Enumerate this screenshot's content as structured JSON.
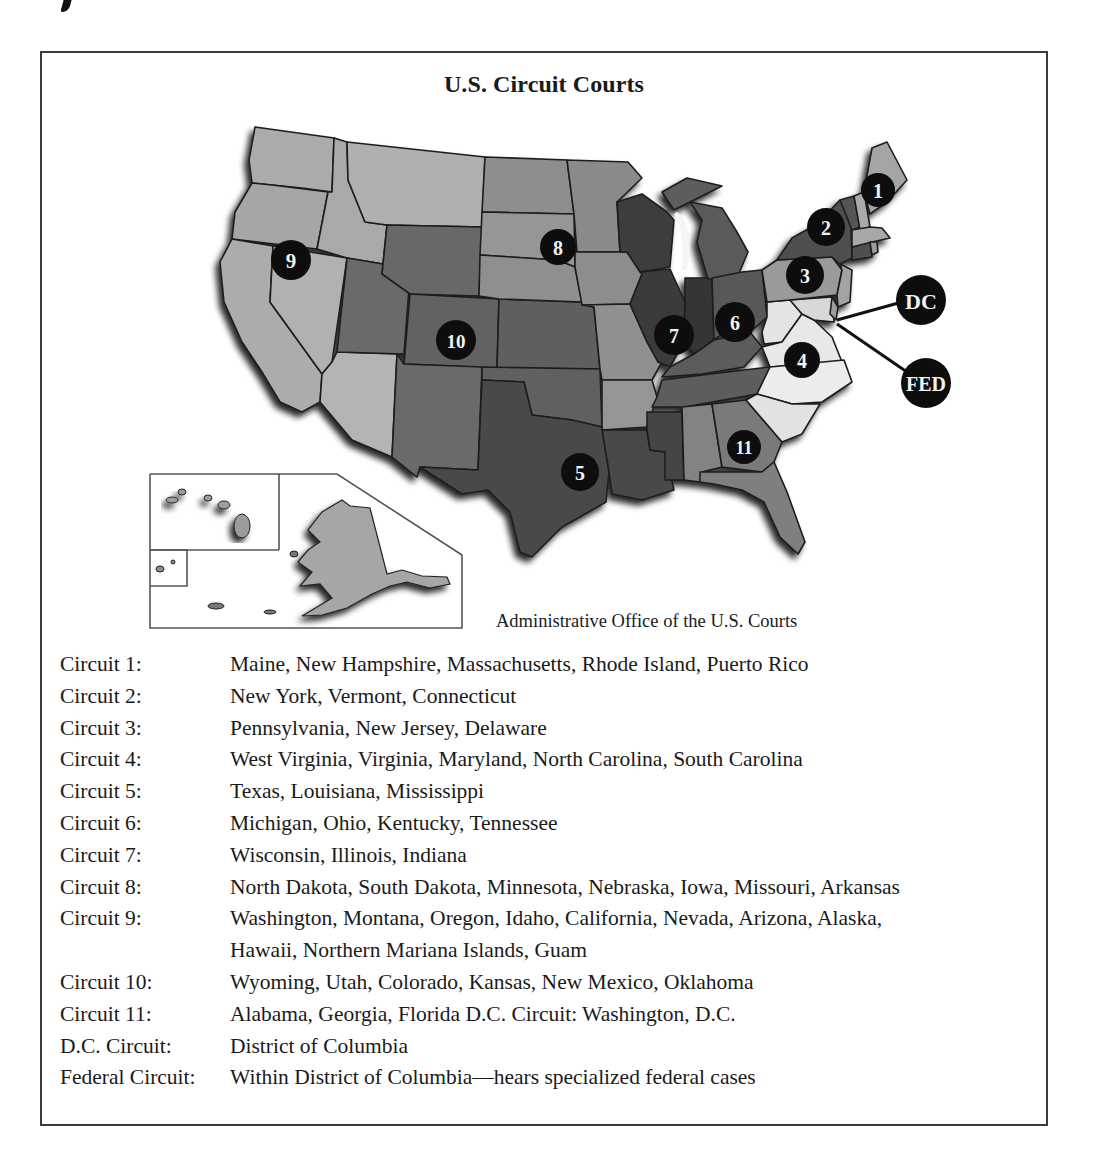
{
  "figure": {
    "title": "U.S. Circuit Courts",
    "credit": "Administrative Office of the U.S. Courts"
  },
  "map": {
    "markers": [
      {
        "label": "1",
        "circuit": "Circuit 1"
      },
      {
        "label": "2",
        "circuit": "Circuit 2"
      },
      {
        "label": "3",
        "circuit": "Circuit 3"
      },
      {
        "label": "4",
        "circuit": "Circuit 4"
      },
      {
        "label": "5",
        "circuit": "Circuit 5"
      },
      {
        "label": "6",
        "circuit": "Circuit 6"
      },
      {
        "label": "7",
        "circuit": "Circuit 7"
      },
      {
        "label": "8",
        "circuit": "Circuit 8"
      },
      {
        "label": "9",
        "circuit": "Circuit 9"
      },
      {
        "label": "10",
        "circuit": "Circuit 10"
      },
      {
        "label": "11",
        "circuit": "Circuit 11"
      },
      {
        "label": "DC",
        "circuit": "D.C. Circuit"
      },
      {
        "label": "FED",
        "circuit": "Federal Circuit"
      }
    ],
    "colors": {
      "circuit_1": "#a9a9a9",
      "circuit_2": "#4f4f4f",
      "circuit_3": "#9a9a9a",
      "circuit_4": "#e6e6e6",
      "circuit_5": "#4a4a4a",
      "circuit_6": "#5a5a5a",
      "circuit_7": "#3a3a3a",
      "circuit_8": "#8c8c8c",
      "circuit_9": "#ababab",
      "circuit_10": "#656565",
      "circuit_11": "#7d7d7d",
      "marker": "#0d0d0d",
      "border": "#1e1e1e"
    }
  },
  "legend": [
    {
      "label": "Circuit 1:",
      "value": "Maine, New Hampshire, Massachusetts, Rhode Island, Puerto Rico"
    },
    {
      "label": "Circuit 2:",
      "value": "New York, Vermont, Connecticut"
    },
    {
      "label": "Circuit 3:",
      "value": "Pennsylvania, New Jersey, Delaware"
    },
    {
      "label": "Circuit 4:",
      "value": "West Virginia, Virginia, Maryland, North Carolina, South Carolina"
    },
    {
      "label": "Circuit 5:",
      "value": "Texas, Louisiana, Mississippi"
    },
    {
      "label": "Circuit 6:",
      "value": "Michigan, Ohio, Kentucky, Tennessee"
    },
    {
      "label": "Circuit 7:",
      "value": "Wisconsin, Illinois, Indiana"
    },
    {
      "label": "Circuit 8:",
      "value": "North Dakota, South Dakota, Minnesota, Nebraska, Iowa, Missouri, Arkansas"
    },
    {
      "label": "Circuit 9:",
      "value": "Washington, Montana, Oregon, Idaho, California, Nevada, Arizona, Alaska,"
    },
    {
      "label": "",
      "value": "Hawaii, Northern Mariana Islands, Guam"
    },
    {
      "label": "Circuit 10:",
      "value": "Wyoming, Utah, Colorado, Kansas, New Mexico, Oklahoma"
    },
    {
      "label": "Circuit 11:",
      "value": "Alabama, Georgia, Florida D.C. Circuit: Washington, D.C."
    },
    {
      "label": "D.C. Circuit:",
      "value": "District of Columbia"
    },
    {
      "label": "Federal Circuit:",
      "value": "Within District of Columbia—hears specialized federal cases"
    }
  ]
}
